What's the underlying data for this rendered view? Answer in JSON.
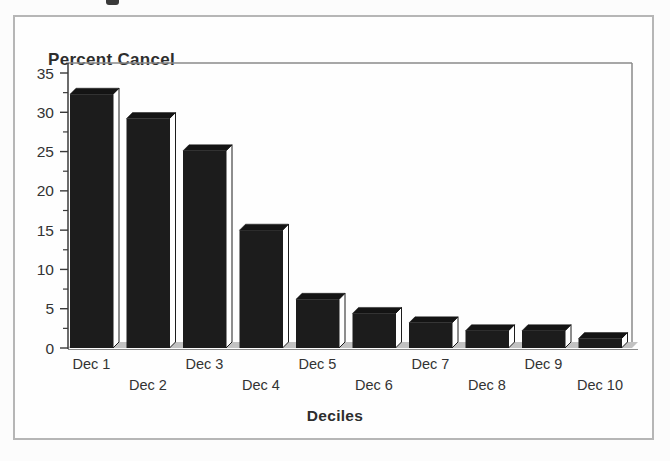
{
  "chart_data": {
    "type": "bar",
    "title": "Percent Cancel",
    "xlabel": "Deciles",
    "ylabel": "",
    "categories": [
      "Dec  1",
      "Dec 2",
      "Dec 3",
      "Dec 4",
      "Dec 5",
      "Dec 6",
      "Dec 7",
      "Dec 8",
      "Dec 9",
      "Dec 10"
    ],
    "values": [
      32.3,
      29.2,
      25.1,
      15.0,
      6.2,
      4.4,
      3.2,
      2.2,
      2.2,
      1.2
    ],
    "ylim": [
      0,
      35
    ],
    "yticks": [
      0,
      5,
      10,
      15,
      20,
      25,
      30,
      35
    ],
    "minor_tick_interval": 2.5,
    "grid": false,
    "legend": "none",
    "style": "3d-black-bars",
    "colors": {
      "bar_front": "#1c1c1c",
      "bar_top": "#141414",
      "bar_side": "#ffffff",
      "floor": "#c2c2c2",
      "axis": "#3a3a3a",
      "plot_border": "#8a8a8a",
      "text": "#333333",
      "frame_border": "#b6b6b6"
    }
  }
}
